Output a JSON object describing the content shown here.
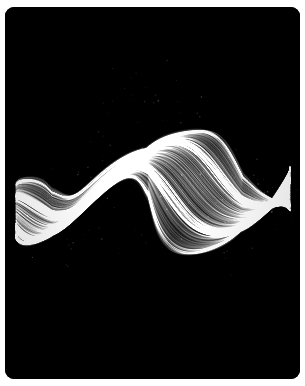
{
  "artwork": {
    "title": "Generative Flow Ribbon",
    "canvas": {
      "width": 305,
      "height": 386,
      "panel_x": 5,
      "panel_y": 7,
      "panel_width": 295,
      "panel_height": 372,
      "panel_radius": 9,
      "page_background": "#ffffff",
      "panel_background": "#000000"
    },
    "palette": {
      "background": "#000000",
      "stroke": "#ffffff",
      "highlight": "#f2f2f2",
      "mid_tone": "#8a8a8a",
      "shadow_tone": "#2a2a2a",
      "page": "#ffffff"
    },
    "composition": {
      "type": "flow-field-ribbon",
      "description": "Dense bundle of thin near-parallel sine strands forming a horizontal S-curve ribbon on black",
      "strand_count": 620,
      "points_per_strand": 260,
      "line_width": 0.38,
      "base_alpha": 0.16,
      "blend_mode": "lighter",
      "ribbon_center_y": 193,
      "ribbon_left_x": 16,
      "ribbon_right_x": 290,
      "ribbon_band_half_height": 46,
      "wave_amplitude": 30,
      "wave_frequency": 1.45,
      "wave_phase": 0.35,
      "twist_amount": 1.15,
      "taper_power": 0.62,
      "noise_jitter": 0.55,
      "particle_count": 170,
      "particle_alpha": 0.24,
      "seed": 20254
    },
    "vertical_extent": {
      "top": 145,
      "bottom": 248
    }
  }
}
